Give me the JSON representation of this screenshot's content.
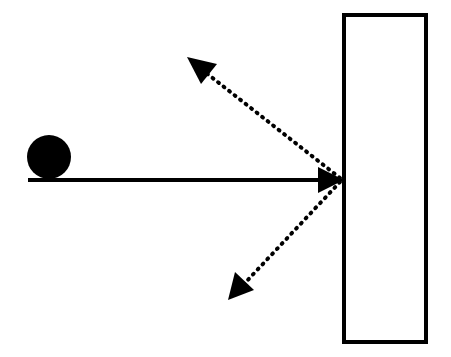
{
  "diagram": {
    "colors": {
      "stroke": "#000000",
      "background": "#ffffff",
      "wall_fill": "#ffffff"
    },
    "ball": {
      "cx": 49,
      "cy": 157,
      "r": 22
    },
    "incident_arrow": {
      "x1": 28,
      "y1": 180,
      "x2": 342,
      "y2": 180,
      "style": "solid"
    },
    "reflected_arrow_up": {
      "x1": 340,
      "y1": 178,
      "x2": 188,
      "y2": 57,
      "style": "dotted"
    },
    "reflected_arrow_down": {
      "x1": 340,
      "y1": 182,
      "x2": 228,
      "y2": 300,
      "style": "dotted"
    },
    "wall": {
      "x": 344,
      "y": 15,
      "width": 82,
      "height": 327
    }
  }
}
